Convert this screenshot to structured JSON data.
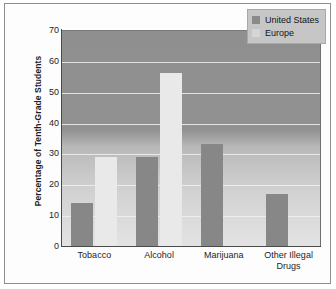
{
  "chart_data": {
    "type": "bar",
    "title": "",
    "xlabel": "",
    "ylabel": "Percentage of Tenth-Grade Students",
    "ylim": [
      0,
      70
    ],
    "ytick_step": 10,
    "yticks": [
      0,
      10,
      20,
      30,
      40,
      50,
      60,
      70
    ],
    "grid": true,
    "legend_position": "top-right",
    "categories": [
      "Tobacco",
      "Alcohol",
      "Marijuana",
      "Other Illegal Drugs"
    ],
    "category_lines": [
      [
        "Tobacco"
      ],
      [
        "Alcohol"
      ],
      [
        "Marijuana"
      ],
      [
        "Other Illegal",
        "Drugs"
      ]
    ],
    "series": [
      {
        "name": "United States",
        "color": "#878787",
        "values": [
          14,
          29,
          33,
          17
        ]
      },
      {
        "name": "Europe",
        "color": "#e9e9e9",
        "values": [
          29,
          56,
          0,
          0
        ]
      }
    ]
  },
  "legend": {
    "items": [
      {
        "label": "United States"
      },
      {
        "label": "Europe"
      }
    ]
  }
}
